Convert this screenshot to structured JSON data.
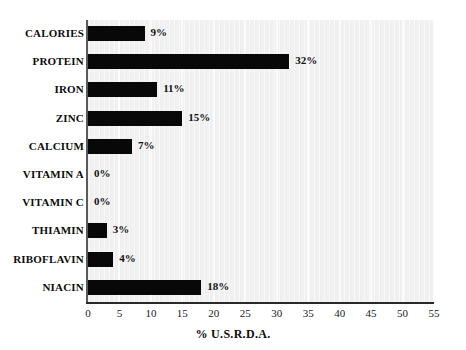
{
  "chart_data": {
    "type": "bar",
    "orientation": "horizontal",
    "title": "",
    "subtitle": "",
    "xlabel": "% U.S.R.D.A.",
    "ylabel": "",
    "xlim": [
      0,
      55
    ],
    "xticks": [
      0,
      5,
      10,
      15,
      20,
      25,
      30,
      35,
      40,
      45,
      50,
      55
    ],
    "xtick_labels": [
      "0",
      "5",
      "10",
      "15",
      "20",
      "25",
      "30",
      "35",
      "40",
      "45",
      "50",
      "55"
    ],
    "grid": true,
    "grid_axis": "x",
    "legend": false,
    "categories": [
      "CALORIES",
      "PROTEIN",
      "IRON",
      "ZINC",
      "CALCIUM",
      "VITAMIN A",
      "VITAMIN C",
      "THIAMIN",
      "RIBOFLAVIN",
      "NIACIN"
    ],
    "values": [
      9,
      32,
      11,
      15,
      7,
      0,
      0,
      3,
      4,
      18
    ],
    "data_labels": [
      "9%",
      "32%",
      "11%",
      "15%",
      "7%",
      "0%",
      "0%",
      "3%",
      "4%",
      "18%"
    ],
    "bar_color": "#080808",
    "plot_background": "#f1f1f1",
    "axis_color": "#2a2a2a"
  }
}
